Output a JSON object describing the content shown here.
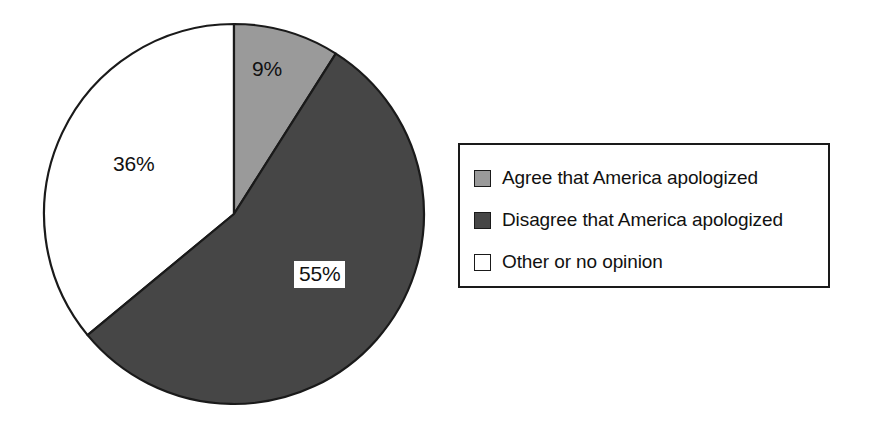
{
  "chart_data": {
    "type": "pie",
    "title": "",
    "subtitle": "",
    "xlabel": "",
    "ylabel": "",
    "categories": [
      "Agree that America apologized",
      "Disagree that America apologized",
      "Other or no opinion"
    ],
    "values": [
      9,
      55,
      36
    ],
    "value_labels": [
      "9%",
      "55%",
      "36%"
    ],
    "colors": [
      "#9a9a9a",
      "#464646",
      "#ffffff"
    ],
    "slice_outline_color": "#1a1a1a",
    "start_angle_deg": 0,
    "direction": "clockwise",
    "legend_position": "right",
    "grid": false,
    "units": "percent",
    "annotations": [
      {
        "text": "9%",
        "slice": "Agree that America apologized"
      },
      {
        "text": "55%",
        "slice": "Disagree that America apologized",
        "boxed": true
      },
      {
        "text": "36%",
        "slice": "Other or no opinion"
      }
    ]
  },
  "pie": {
    "slices": [
      {
        "id": "agree",
        "label": "9%",
        "value": 9,
        "color": "#9a9a9a"
      },
      {
        "id": "disagree",
        "label": "55%",
        "value": 55,
        "color": "#464646"
      },
      {
        "id": "other",
        "label": "36%",
        "value": 36,
        "color": "#ffffff"
      }
    ],
    "label_agree": "9%",
    "label_disagree": "55%",
    "label_other": "36%"
  },
  "legend": {
    "items": [
      {
        "label": "Agree that America apologized",
        "color": "#9a9a9a",
        "swatch": "filled-gray-swatch"
      },
      {
        "label": "Disagree that America apologized",
        "color": "#464646",
        "swatch": "filled-dark-gray-swatch"
      },
      {
        "label": "Other or no opinion",
        "color": "#ffffff",
        "swatch": "empty-white-swatch"
      }
    ]
  }
}
